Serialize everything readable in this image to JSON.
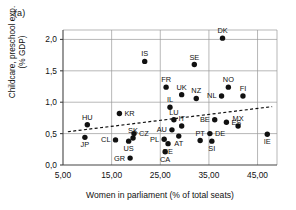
{
  "figure": {
    "panel_label": "(a)",
    "xlabel": "Women in parliament (% of total seats)",
    "ylabel_line1": "Childcare, preschool exp.",
    "ylabel_line2": "(% GDP)",
    "axis_color": "#111111",
    "grid_color": "#9a9a9a",
    "marker_color": "#111111"
  },
  "chart_data": {
    "type": "scatter",
    "title": "",
    "xlabel": "Women in parliament (% of total seats)",
    "ylabel": "Childcare, preschool exp. (% GDP)",
    "xlim": [
      5.0,
      49.0
    ],
    "ylim": [
      0.0,
      2.15
    ],
    "xticks": [
      5.0,
      15.0,
      25.0,
      35.0,
      45.0
    ],
    "xticklabels": [
      "5,00",
      "15,00",
      "25,00",
      "35,00",
      "45,00"
    ],
    "yticks": [
      0.0,
      0.5,
      1.0,
      1.5,
      2.0
    ],
    "yticklabels": [
      "0,0",
      "0,5",
      "1,0",
      "1,5",
      "2,0"
    ],
    "grid": "both",
    "legend": "none",
    "points": [
      {
        "label": "JP",
        "x": 9.5,
        "y": 0.44,
        "label_pos": "below"
      },
      {
        "label": "HU",
        "x": 10.0,
        "y": 0.64,
        "label_pos": "above"
      },
      {
        "label": "CL",
        "x": 15.8,
        "y": 0.4,
        "label_pos": "left"
      },
      {
        "label": "KR",
        "x": 16.6,
        "y": 0.82,
        "label_pos": "right"
      },
      {
        "label": "GR",
        "x": 18.8,
        "y": 0.11,
        "label_pos": "left"
      },
      {
        "label": "US",
        "x": 18.5,
        "y": 0.38,
        "label_pos": "below"
      },
      {
        "label": "CZ",
        "x": 19.6,
        "y": 0.5,
        "label_pos": "right"
      },
      {
        "label": "SK",
        "x": 19.4,
        "y": 0.43,
        "label_pos": "above"
      },
      {
        "label": "IS",
        "x": 21.8,
        "y": 1.65,
        "label_pos": "above"
      },
      {
        "label": "PL",
        "x": 25.8,
        "y": 0.41,
        "label_pos": "left"
      },
      {
        "label": "CA",
        "x": 26.0,
        "y": 0.21,
        "label_pos": "below"
      },
      {
        "label": "EE",
        "x": 26.6,
        "y": 0.34,
        "label_pos": "below"
      },
      {
        "label": "FR",
        "x": 26.2,
        "y": 1.24,
        "label_pos": "above"
      },
      {
        "label": "IL",
        "x": 27.0,
        "y": 0.92,
        "label_pos": "above"
      },
      {
        "label": "AU",
        "x": 27.4,
        "y": 0.56,
        "label_pos": "left"
      },
      {
        "label": "LU",
        "x": 27.8,
        "y": 0.72,
        "label_pos": "above"
      },
      {
        "label": "AT",
        "x": 28.8,
        "y": 0.46,
        "label_pos": "below"
      },
      {
        "label": "IT",
        "x": 29.4,
        "y": 0.62,
        "label_pos": "above"
      },
      {
        "label": "UK",
        "x": 29.4,
        "y": 1.12,
        "label_pos": "above"
      },
      {
        "label": "SE",
        "x": 32.0,
        "y": 1.6,
        "label_pos": "above"
      },
      {
        "label": "NZ",
        "x": 32.4,
        "y": 1.06,
        "label_pos": "above"
      },
      {
        "label": "PT",
        "x": 33.2,
        "y": 0.39,
        "label_pos": "above"
      },
      {
        "label": "DE",
        "x": 35.2,
        "y": 0.5,
        "label_pos": "right"
      },
      {
        "label": "SI",
        "x": 35.6,
        "y": 0.38,
        "label_pos": "below"
      },
      {
        "label": "BE",
        "x": 36.2,
        "y": 0.72,
        "label_pos": "left"
      },
      {
        "label": "NL",
        "x": 37.6,
        "y": 1.1,
        "label_pos": "left"
      },
      {
        "label": "DK",
        "x": 37.8,
        "y": 2.02,
        "label_pos": "above"
      },
      {
        "label": "ES",
        "x": 38.6,
        "y": 0.68,
        "label_pos": "right"
      },
      {
        "label": "NO",
        "x": 39.0,
        "y": 1.24,
        "label_pos": "above"
      },
      {
        "label": "MX",
        "x": 41.0,
        "y": 0.62,
        "label_pos": "above"
      },
      {
        "label": "FI",
        "x": 42.0,
        "y": 1.1,
        "label_pos": "above"
      },
      {
        "label": "IE",
        "x": 47.0,
        "y": 0.49,
        "label_pos": "below"
      }
    ],
    "trendline": {
      "style": "dashed",
      "x_start": 6.0,
      "y_start": 0.53,
      "x_end": 48.0,
      "y_end": 0.93
    }
  }
}
